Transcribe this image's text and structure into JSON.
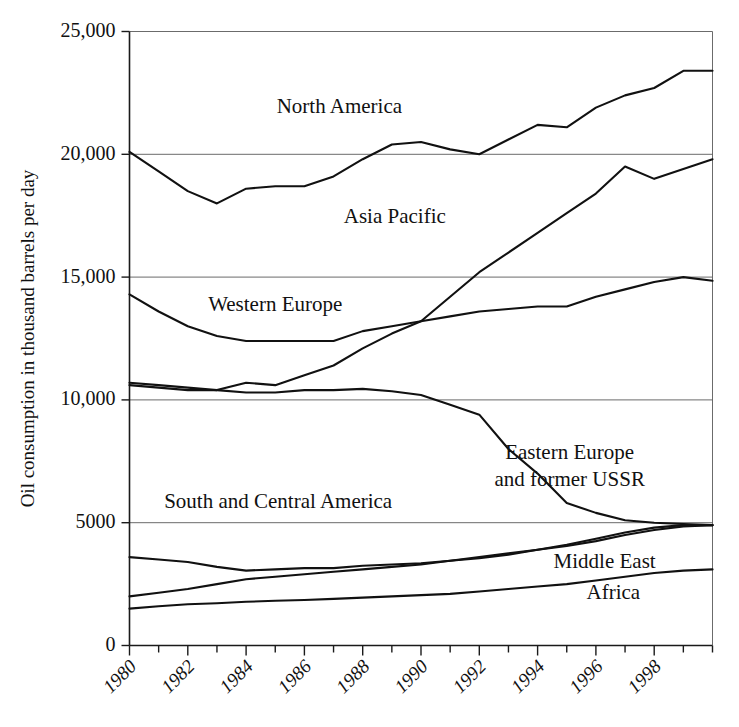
{
  "chart_data": {
    "type": "line",
    "title": "",
    "xlabel": "",
    "ylabel": "Oil consumption in thousand barrels per day",
    "xlim": [
      1980,
      2000
    ],
    "ylim": [
      0,
      25000
    ],
    "ytick_labels": [
      "0",
      "5000",
      "10,000",
      "15,000",
      "20,000",
      "25,000"
    ],
    "ytick_values": [
      0,
      5000,
      10000,
      15000,
      20000,
      25000
    ],
    "xtick_labels": [
      "1980",
      "1982",
      "1984",
      "1986",
      "1988",
      "1990",
      "1992",
      "1994",
      "1996",
      "1998"
    ],
    "xtick_values": [
      1980,
      1982,
      1984,
      1986,
      1988,
      1990,
      1992,
      1994,
      1996,
      1998
    ],
    "x": [
      1980,
      1981,
      1982,
      1983,
      1984,
      1985,
      1986,
      1987,
      1988,
      1989,
      1990,
      1991,
      1992,
      1993,
      1994,
      1995,
      1996,
      1997,
      1998,
      1999,
      2000
    ],
    "grid": true,
    "grid_axis": "y",
    "legend": "inline-labels",
    "series": [
      {
        "name": "North America",
        "label_x": 1987.2,
        "label_y": 21700,
        "values": [
          20100,
          19300,
          18500,
          18000,
          18600,
          18700,
          18700,
          19100,
          19800,
          20400,
          20500,
          20200,
          20000,
          20600,
          21200,
          21100,
          21900,
          22400,
          22700,
          23400,
          23400
        ]
      },
      {
        "name": "Asia Pacific",
        "label_x": 1989.1,
        "label_y": 17200,
        "values": [
          10600,
          10500,
          10400,
          10400,
          10700,
          10600,
          11000,
          11400,
          12100,
          12700,
          13200,
          14200,
          15200,
          16000,
          16800,
          17600,
          18400,
          19500,
          19000,
          19400,
          19800
        ]
      },
      {
        "name": "Western Europe",
        "label_x": 1985.0,
        "label_y": 13600,
        "values": [
          14300,
          13600,
          13000,
          12600,
          12400,
          12400,
          12400,
          12400,
          12800,
          13000,
          13200,
          13400,
          13600,
          13700,
          13800,
          13800,
          14200,
          14500,
          14800,
          15000,
          14850
        ]
      },
      {
        "name": "Eastern Europe and former USSR",
        "label_x": 1995.1,
        "label_y": 7600,
        "values": [
          10700,
          10600,
          10500,
          10400,
          10300,
          10300,
          10400,
          10400,
          10450,
          10350,
          10200,
          9800,
          9400,
          8000,
          7000,
          5800,
          5400,
          5100,
          5000,
          4950,
          4900
        ]
      },
      {
        "name": "South and Central America",
        "label_x": 1985.1,
        "label_y": 5600,
        "values": [
          3600,
          3500,
          3400,
          3200,
          3050,
          3100,
          3150,
          3150,
          3250,
          3300,
          3350,
          3450,
          3550,
          3700,
          3900,
          4100,
          4350,
          4600,
          4800,
          4900,
          4900
        ]
      },
      {
        "name": "Middle East",
        "label_x": 1996.3,
        "label_y": 3150,
        "values": [
          2000,
          2150,
          2300,
          2500,
          2700,
          2800,
          2900,
          3000,
          3100,
          3200,
          3300,
          3450,
          3600,
          3750,
          3900,
          4050,
          4250,
          4500,
          4700,
          4850,
          4900
        ]
      },
      {
        "name": "Africa",
        "label_x": 1996.6,
        "label_y": 1900,
        "values": [
          1500,
          1600,
          1680,
          1720,
          1780,
          1820,
          1850,
          1900,
          1950,
          2000,
          2050,
          2100,
          2200,
          2300,
          2400,
          2500,
          2650,
          2800,
          2950,
          3050,
          3100
        ]
      }
    ]
  }
}
